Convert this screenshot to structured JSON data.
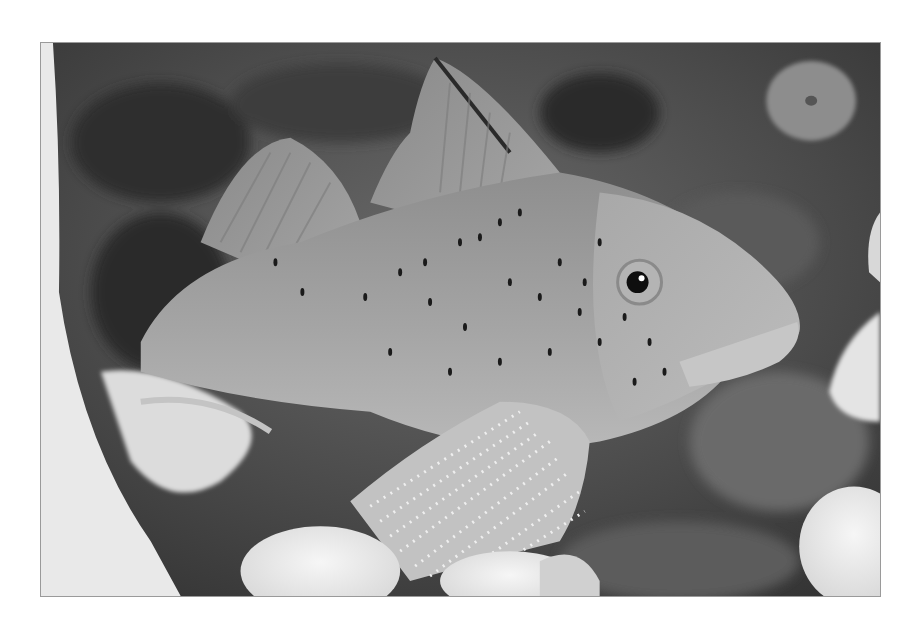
{
  "image": {
    "subject": "Spotted fish resting among sea anemones on rocky seabed",
    "style": "grayscale photograph",
    "colors": {
      "page_background": "#ffffff",
      "frame_border": "#9a9a9a",
      "background_dark": "#3a3a3a",
      "fish_body": "#9a9a9a",
      "fish_highlight": "#c8c8c8",
      "anemone": "#ececec",
      "spots": "#1a1a1a"
    },
    "elements": [
      "fish",
      "dorsal-fin",
      "pectoral-fin",
      "eye",
      "anemones",
      "rocky-seabed"
    ]
  }
}
